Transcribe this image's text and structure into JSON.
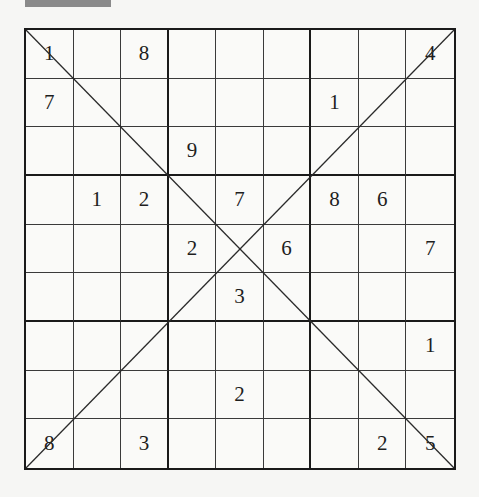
{
  "puzzle": {
    "type": "X-Sudoku",
    "size": 9,
    "box_size": 3,
    "diagonals": [
      "main-diagonal",
      "anti-diagonal"
    ],
    "grid": [
      [
        "1",
        "",
        "8",
        "",
        "",
        "",
        "",
        "",
        "4"
      ],
      [
        "7",
        "",
        "",
        "",
        "",
        "",
        "1",
        "",
        ""
      ],
      [
        "",
        "",
        "",
        "9",
        "",
        "",
        "",
        "",
        ""
      ],
      [
        "",
        "1",
        "2",
        "",
        "7",
        "",
        "8",
        "6",
        ""
      ],
      [
        "",
        "",
        "",
        "2",
        "",
        "6",
        "",
        "",
        "7"
      ],
      [
        "",
        "",
        "",
        "",
        "3",
        "",
        "",
        "",
        ""
      ],
      [
        "",
        "",
        "",
        "",
        "",
        "",
        "",
        "",
        "1"
      ],
      [
        "",
        "",
        "",
        "",
        "2",
        "",
        "",
        "",
        ""
      ],
      [
        "8",
        "",
        "3",
        "",
        "",
        "",
        "",
        "2",
        "5"
      ]
    ]
  },
  "colors": {
    "background": "#f6f6f4",
    "grid_line": "#1a1a1a",
    "digit": "#1e1e1e",
    "banner": "#8a8a8a"
  }
}
